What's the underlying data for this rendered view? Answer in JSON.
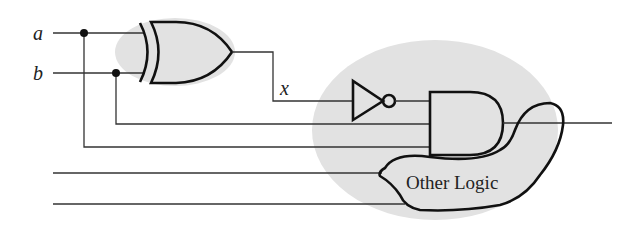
{
  "diagram": {
    "type": "logic-circuit",
    "inputs": [
      {
        "label": "a"
      },
      {
        "label": "b"
      }
    ],
    "intermediate_signal": {
      "label": "x"
    },
    "gates": [
      {
        "name": "xor-gate",
        "type": "XOR",
        "inputs": [
          "a",
          "b"
        ],
        "output": "x"
      },
      {
        "name": "not-gate",
        "type": "NOT",
        "inputs": [
          "x"
        ]
      },
      {
        "name": "and-gate",
        "type": "AND",
        "inputs": [
          "not x",
          "b",
          "a"
        ]
      }
    ],
    "block": {
      "label": "Other Logic"
    },
    "highlight_regions": [
      "xor-region",
      "and-region"
    ],
    "colors": {
      "highlight": "#e2e2e2",
      "line": "#111111",
      "background": "#ffffff"
    }
  }
}
